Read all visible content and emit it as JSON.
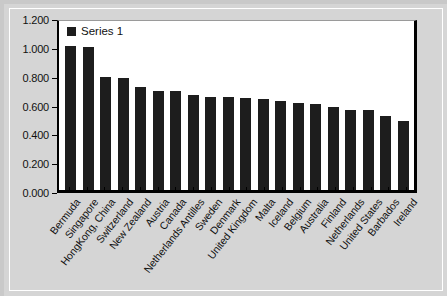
{
  "chart_data": {
    "type": "bar",
    "title": "",
    "xlabel": "",
    "ylabel": "",
    "ylim": [
      0,
      1.2
    ],
    "ytick_step": 0.2,
    "grid": false,
    "legend_position": "top-left",
    "bar_color": "#1d1d1d",
    "plot_background": "#ffffff",
    "page_background": "#d5d5d5",
    "ytick_labels": [
      "1.200",
      "1.000",
      "0.800",
      "0.600",
      "0.400",
      "0.200",
      "0.000"
    ],
    "ytick_values": [
      1.2,
      1.0,
      0.8,
      0.6,
      0.4,
      0.2,
      0.0
    ],
    "series": [
      {
        "name": "Series 1",
        "values": [
          1.0,
          0.99,
          0.785,
          0.78,
          0.715,
          0.685,
          0.685,
          0.66,
          0.645,
          0.645,
          0.635,
          0.63,
          0.62,
          0.605,
          0.6,
          0.575,
          0.555,
          0.555,
          0.51,
          0.48
        ]
      }
    ],
    "categories": [
      "Bermuda",
      "Singapore",
      "HongKong, China",
      "Switzerland",
      "New Zealand",
      "Austria",
      "Canada",
      "Netherlands Antilles",
      "Sweden",
      "Denmark",
      "United Kingdom",
      "Malta",
      "Iceland",
      "Belgium",
      "Australia",
      "Finland",
      "Netherlands",
      "United States",
      "Barbados",
      "Ireland"
    ]
  },
  "legend": {
    "entries": [
      {
        "label": "Series 1",
        "color": "#1d1d1d"
      }
    ]
  }
}
